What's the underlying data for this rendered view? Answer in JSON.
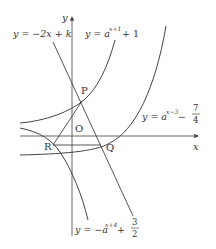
{
  "diagram": {
    "axes": {
      "x_label": "x",
      "y_label": "y",
      "origin_label": "O"
    },
    "points": {
      "P": "P",
      "Q": "Q",
      "R": "R"
    },
    "labels": {
      "line": {
        "prefix": "y = −2x + k"
      },
      "curve1": {
        "base": "y = a",
        "exp": "x+1",
        "tail": " + 1"
      },
      "curve2": {
        "base": "y = a",
        "exp": "x−3",
        "tail": " − ",
        "frac_num": "7",
        "frac_den": "4"
      },
      "curve3": {
        "base": "y = −a",
        "exp": "x+4",
        "tail": " + ",
        "frac_num": "3",
        "frac_den": "2"
      }
    },
    "colors": {
      "stroke": "#444444",
      "text": "#333333",
      "background": "#ffffff"
    }
  }
}
